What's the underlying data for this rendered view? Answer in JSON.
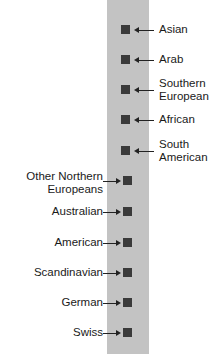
{
  "diagram": {
    "right_items": [
      {
        "label_line1": "Asian",
        "label_line2": ""
      },
      {
        "label_line1": "Arab",
        "label_line2": ""
      },
      {
        "label_line1": "Southern",
        "label_line2": "European"
      },
      {
        "label_line1": "African",
        "label_line2": ""
      },
      {
        "label_line1": "South",
        "label_line2": "American"
      }
    ],
    "left_items": [
      {
        "label_line1": "Other Northern",
        "label_line2": "Europeans"
      },
      {
        "label_line1": "Australian",
        "label_line2": ""
      },
      {
        "label_line1": "American",
        "label_line2": ""
      },
      {
        "label_line1": "Scandinavian",
        "label_line2": ""
      },
      {
        "label_line1": "German",
        "label_line2": ""
      },
      {
        "label_line1": "Swiss",
        "label_line2": ""
      }
    ],
    "colors": {
      "bar": "#c3c3c3",
      "marker": "#3a3a3a"
    }
  }
}
